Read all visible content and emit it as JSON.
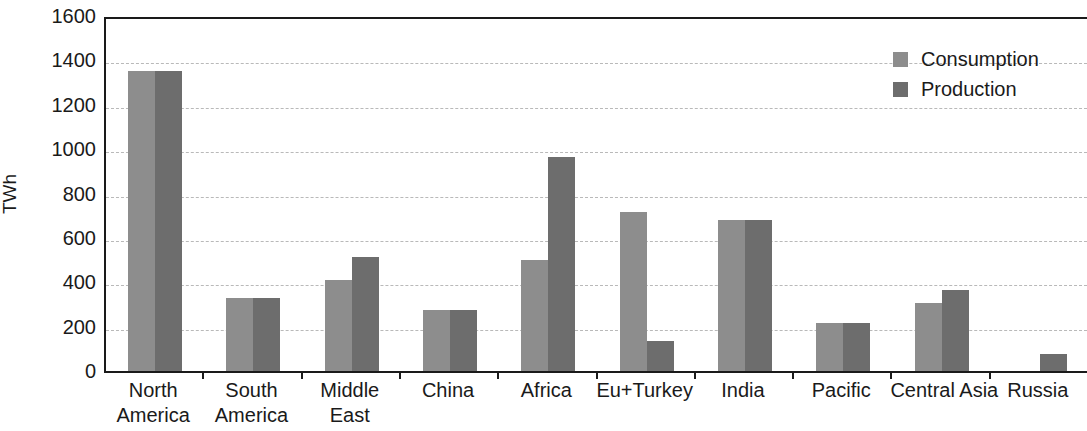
{
  "chart_data": {
    "type": "bar",
    "title": "",
    "xlabel": "",
    "ylabel": "TWh",
    "ylim": [
      0,
      1600
    ],
    "yticks": [
      0,
      200,
      400,
      600,
      800,
      1000,
      1200,
      1400,
      1600
    ],
    "ytick_labels": [
      "0",
      "200",
      "400",
      "600",
      "800",
      "1000",
      "1200",
      "1400",
      "1600"
    ],
    "grid": true,
    "legend_position": "top-right",
    "categories": [
      "North America",
      "South America",
      "Middle East",
      "China",
      "Africa",
      "Eu+Turkey",
      "India",
      "Pacific",
      "Central Asia",
      "Russia"
    ],
    "category_lines": [
      [
        "North",
        "America"
      ],
      [
        "South",
        "America"
      ],
      [
        "Middle",
        "East"
      ],
      [
        "China",
        ""
      ],
      [
        "Africa",
        ""
      ],
      [
        "Eu+Turkey",
        ""
      ],
      [
        "India",
        ""
      ],
      [
        "Pacific",
        ""
      ],
      [
        "Central Asia",
        ""
      ],
      [
        "Russia",
        ""
      ]
    ],
    "series": [
      {
        "name": "Consumption",
        "color": "#8d8d8d",
        "values": [
          1355,
          335,
          415,
          280,
          505,
          720,
          685,
          220,
          310,
          0
        ]
      },
      {
        "name": "Production",
        "color": "#6d6d6d",
        "values": [
          1355,
          335,
          520,
          280,
          970,
          140,
          685,
          220,
          370,
          80
        ]
      }
    ]
  },
  "legend": {
    "entries": [
      {
        "label": "Consumption",
        "color": "#8d8d8d"
      },
      {
        "label": "Production",
        "color": "#6d6d6d"
      }
    ]
  },
  "axes": {
    "y_title": "TWh"
  },
  "colors": {
    "consumption": "#8d8d8d",
    "production": "#6d6d6d",
    "axis": "#1a1a1a",
    "grid": "#b9b9b9",
    "background": "#ffffff"
  }
}
